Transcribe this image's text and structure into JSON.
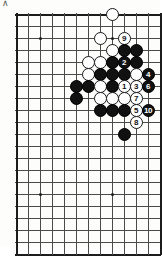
{
  "figure": {
    "corner_mark": "∧",
    "caption": "",
    "board": {
      "type": "go-board-diagram",
      "grid_cols": 12,
      "grid_rows": 20,
      "line_color": "#4a4a4a",
      "edge_color": "#1c1c1c",
      "background": "#fdfdfc",
      "origin_x": 16,
      "origin_y": 14,
      "spacing": 12,
      "star_points": [
        {
          "col": 2,
          "row": 2
        },
        {
          "col": 8,
          "row": 2
        },
        {
          "col": 2,
          "row": 15
        },
        {
          "col": 8,
          "row": 15
        }
      ],
      "stones": [
        {
          "col": 8,
          "row": 0,
          "color": "white",
          "label": ""
        },
        {
          "col": 7,
          "row": 2,
          "color": "white",
          "label": ""
        },
        {
          "col": 9,
          "row": 2,
          "color": "white",
          "label": "9",
          "move": 9
        },
        {
          "col": 8,
          "row": 3,
          "color": "white",
          "label": ""
        },
        {
          "col": 9,
          "row": 3,
          "color": "black",
          "label": ""
        },
        {
          "col": 10,
          "row": 3,
          "color": "black",
          "label": ""
        },
        {
          "col": 6,
          "row": 4,
          "color": "white",
          "label": ""
        },
        {
          "col": 7,
          "row": 4,
          "color": "white",
          "label": ""
        },
        {
          "col": 8,
          "row": 4,
          "color": "black",
          "label": ""
        },
        {
          "col": 9,
          "row": 4,
          "color": "black",
          "label": "2",
          "move": 2
        },
        {
          "col": 10,
          "row": 4,
          "color": "black",
          "label": ""
        },
        {
          "col": 6,
          "row": 5,
          "color": "white",
          "label": ""
        },
        {
          "col": 7,
          "row": 5,
          "color": "black",
          "label": ""
        },
        {
          "col": 8,
          "row": 5,
          "color": "black",
          "label": ""
        },
        {
          "col": 9,
          "row": 5,
          "color": "black",
          "label": ""
        },
        {
          "col": 10,
          "row": 5,
          "color": "white",
          "label": ""
        },
        {
          "col": 11,
          "row": 5,
          "color": "black",
          "label": "4",
          "move": 4
        },
        {
          "col": 5,
          "row": 6,
          "color": "black",
          "label": ""
        },
        {
          "col": 6,
          "row": 6,
          "color": "black",
          "label": ""
        },
        {
          "col": 7,
          "row": 6,
          "color": "white",
          "label": ""
        },
        {
          "col": 8,
          "row": 6,
          "color": "black",
          "label": ""
        },
        {
          "col": 9,
          "row": 6,
          "color": "white",
          "label": "1",
          "move": 1
        },
        {
          "col": 10,
          "row": 6,
          "color": "white",
          "label": "3",
          "move": 3
        },
        {
          "col": 11,
          "row": 6,
          "color": "black",
          "label": "6",
          "move": 6
        },
        {
          "col": 5,
          "row": 7,
          "color": "black",
          "label": ""
        },
        {
          "col": 7,
          "row": 7,
          "color": "white",
          "label": ""
        },
        {
          "col": 8,
          "row": 7,
          "color": "white",
          "label": ""
        },
        {
          "col": 9,
          "row": 7,
          "color": "white",
          "label": ""
        },
        {
          "col": 10,
          "row": 7,
          "color": "white",
          "label": "7",
          "move": 7
        },
        {
          "col": 7,
          "row": 8,
          "color": "black",
          "label": ""
        },
        {
          "col": 8,
          "row": 8,
          "color": "black",
          "label": ""
        },
        {
          "col": 9,
          "row": 8,
          "color": "black",
          "label": ""
        },
        {
          "col": 10,
          "row": 8,
          "color": "white",
          "label": "5",
          "move": 5
        },
        {
          "col": 11,
          "row": 8,
          "color": "black",
          "label": "10",
          "move": 10
        },
        {
          "col": 10,
          "row": 9,
          "color": "white",
          "label": "8",
          "move": 8
        },
        {
          "col": 9,
          "row": 10,
          "color": "black",
          "label": ""
        }
      ]
    }
  }
}
